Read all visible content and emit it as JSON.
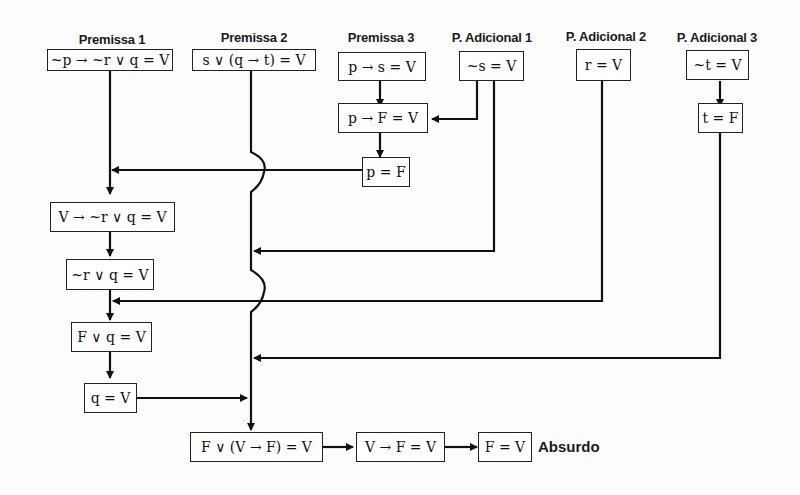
{
  "headers": {
    "p1": "Premissa 1",
    "p2": "Premissa 2",
    "p3": "Premissa 3",
    "pa1": "P. Adicional 1",
    "pa2": "P. Adicional 2",
    "pa3": "P. Adicional 3"
  },
  "boxes": {
    "p1": "~p → ~r ∨ q = V",
    "p2": "s ∨ (q → t) = V",
    "p3": "p → s = V",
    "pa1": "~s = V",
    "pa2": "r = V",
    "pa3": "~t = V",
    "p3_step1": "p → F = V",
    "p3_step2": "p = F",
    "pa3_step1": "t = F",
    "p1_step1": "V → ~r ∨ q = V",
    "p1_step2": "~r ∨ q = V",
    "p1_step3": "F ∨ q = V",
    "p1_step4": "q = V",
    "final1": "F ∨ (V → F) = V",
    "final2": "V → F = V",
    "final3": "F = V"
  },
  "conclusion": "Absurdo",
  "colors": {
    "line": "#111111",
    "border": "#222222"
  }
}
